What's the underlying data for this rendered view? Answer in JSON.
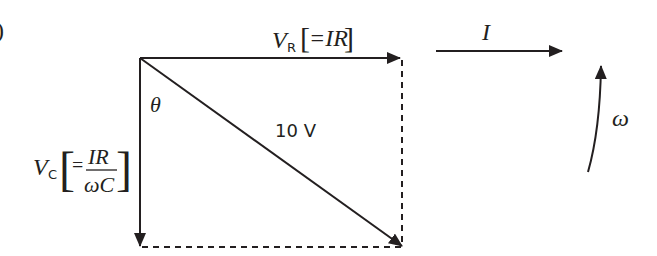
{
  "diagram": {
    "type": "phasor-diagram",
    "part_marker": ")",
    "labels": {
      "vr_symbol": "V",
      "vr_subscript": "R",
      "vr_expression": "=IR",
      "vc_symbol": "V",
      "vc_subscript": "C",
      "vc_numerator": "IR",
      "vc_denominator": "ωC",
      "vc_equals": "=",
      "angle": "θ",
      "resultant": "10 V",
      "current": "I",
      "angular_velocity": "ω"
    },
    "colors": {
      "stroke": "#231f20",
      "background": "#ffffff"
    }
  }
}
